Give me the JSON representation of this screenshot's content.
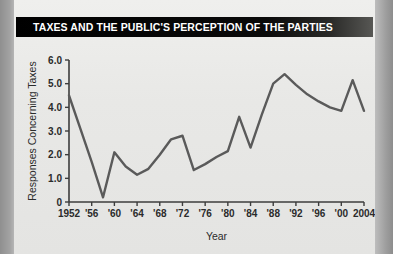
{
  "title": "TAXES AND THE PUBLIC'S PERCEPTION OF THE PARTIES",
  "colors": {
    "banner_background": "#0d0d0d",
    "banner_text": "#ffffff",
    "page_background": "#e9e9e7",
    "outer_margin": "#9a9a9a",
    "line": "#5a5a5a",
    "axis": "#3d3d3d"
  },
  "chart_data": {
    "type": "line",
    "title": "TAXES AND THE PUBLIC'S PERCEPTION OF THE PARTIES",
    "xlabel": "Year",
    "ylabel": "Responses Concerning Taxes",
    "xlim": [
      1952,
      2004
    ],
    "ylim": [
      0,
      6
    ],
    "grid": false,
    "legend": false,
    "ytick_labels": [
      "0",
      "1.0",
      "2.0",
      "3.0",
      "4.0",
      "5.0",
      "6.0"
    ],
    "ytick_values": [
      0,
      1,
      2,
      3,
      4,
      5,
      6
    ],
    "xtick_labels": [
      "1952",
      "'56",
      "'60",
      "'64",
      "'68",
      "'72",
      "'76",
      "'80",
      "'84",
      "'88",
      "'92",
      "'96",
      "'00",
      "2004"
    ],
    "xtick_values": [
      1952,
      1956,
      1960,
      1964,
      1968,
      1972,
      1976,
      1980,
      1984,
      1988,
      1992,
      1996,
      2000,
      2004
    ],
    "x": [
      1952,
      1954,
      1956,
      1958,
      1960,
      1962,
      1964,
      1966,
      1968,
      1970,
      1972,
      1974,
      1976,
      1978,
      1980,
      1982,
      1984,
      1986,
      1988,
      1990,
      1992,
      1994,
      1996,
      1998,
      2000,
      2002,
      2004
    ],
    "values": [
      4.5,
      3.1,
      1.7,
      0.2,
      2.1,
      1.5,
      1.15,
      1.4,
      2.0,
      2.65,
      2.8,
      1.35,
      1.6,
      1.9,
      2.15,
      3.6,
      2.3,
      3.7,
      5.0,
      5.4,
      4.95,
      4.55,
      4.25,
      4.0,
      3.85,
      5.15,
      3.85
    ],
    "series": [
      {
        "name": "Responses Concerning Taxes",
        "values": [
          4.5,
          3.1,
          1.7,
          0.2,
          2.1,
          1.5,
          1.15,
          1.4,
          2.0,
          2.65,
          2.8,
          1.35,
          1.6,
          1.9,
          2.15,
          3.6,
          2.3,
          3.7,
          5.0,
          5.4,
          4.95,
          4.55,
          4.25,
          4.0,
          3.85,
          5.15,
          3.85
        ]
      }
    ]
  }
}
